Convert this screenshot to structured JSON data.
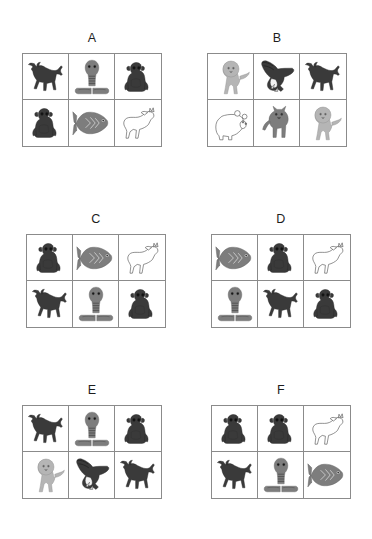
{
  "figure": {
    "type": "animal-icon-grid-panels",
    "panel_count": 6,
    "grid_rows": 2,
    "grid_cols": 3,
    "background_color": "#ffffff",
    "border_color": "#8b8b8b",
    "label_color": "#1d1d1d"
  },
  "legend_colors": {
    "dark": "#3a3a3a",
    "mid_gray": "#7d7d7d",
    "light_gray": "#b5b5b5",
    "outline_white": "#ffffff",
    "stroke": "#4a4a4a"
  },
  "panels": [
    {
      "label": "A",
      "cells": [
        {
          "animal": "bull",
          "shade": "dark"
        },
        {
          "animal": "cobra",
          "shade": "mid_gray"
        },
        {
          "animal": "monkey",
          "shade": "dark"
        },
        {
          "animal": "monkey",
          "shade": "dark"
        },
        {
          "animal": "fish",
          "shade": "mid_gray"
        },
        {
          "animal": "horse",
          "shade": "outline_white"
        }
      ]
    },
    {
      "label": "B",
      "cells": [
        {
          "animal": "lion",
          "shade": "light_gray"
        },
        {
          "animal": "eagle",
          "shade": "dark"
        },
        {
          "animal": "bull",
          "shade": "dark"
        },
        {
          "animal": "bear",
          "shade": "outline_white"
        },
        {
          "animal": "wolf",
          "shade": "mid_gray"
        },
        {
          "animal": "lion",
          "shade": "light_gray"
        }
      ]
    },
    {
      "label": "C",
      "cells": [
        {
          "animal": "monkey",
          "shade": "dark"
        },
        {
          "animal": "fish",
          "shade": "mid_gray"
        },
        {
          "animal": "horse",
          "shade": "outline_white"
        },
        {
          "animal": "bull",
          "shade": "dark"
        },
        {
          "animal": "cobra",
          "shade": "mid_gray"
        },
        {
          "animal": "monkey",
          "shade": "dark"
        }
      ]
    },
    {
      "label": "D",
      "cells": [
        {
          "animal": "fish",
          "shade": "mid_gray"
        },
        {
          "animal": "monkey",
          "shade": "dark"
        },
        {
          "animal": "horse",
          "shade": "outline_white"
        },
        {
          "animal": "cobra",
          "shade": "mid_gray"
        },
        {
          "animal": "bull",
          "shade": "dark"
        },
        {
          "animal": "monkey",
          "shade": "dark"
        }
      ]
    },
    {
      "label": "E",
      "cells": [
        {
          "animal": "bull",
          "shade": "dark"
        },
        {
          "animal": "cobra",
          "shade": "mid_gray"
        },
        {
          "animal": "monkey",
          "shade": "dark"
        },
        {
          "animal": "lion",
          "shade": "light_gray"
        },
        {
          "animal": "eagle",
          "shade": "dark"
        },
        {
          "animal": "bull",
          "shade": "dark"
        }
      ]
    },
    {
      "label": "F",
      "cells": [
        {
          "animal": "monkey",
          "shade": "dark"
        },
        {
          "animal": "monkey",
          "shade": "dark"
        },
        {
          "animal": "horse",
          "shade": "outline_white"
        },
        {
          "animal": "bull",
          "shade": "dark"
        },
        {
          "animal": "cobra",
          "shade": "mid_gray"
        },
        {
          "animal": "fish",
          "shade": "mid_gray"
        }
      ]
    }
  ],
  "panel_positions": [
    {
      "left": 22,
      "top": 31
    },
    {
      "left": 207,
      "top": 31
    },
    {
      "left": 26,
      "top": 212
    },
    {
      "left": 211,
      "top": 212
    },
    {
      "left": 22,
      "top": 383
    },
    {
      "left": 211,
      "top": 383
    }
  ]
}
